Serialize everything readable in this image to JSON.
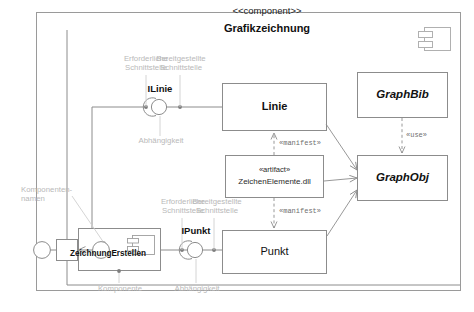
{
  "diagram": {
    "stereotype": "<<component>>",
    "title": "Grafikzeichnung"
  },
  "components": {
    "zeichnung_erstellen": "ZeichnungErstellen",
    "linie": "Linie",
    "punkt": "Punkt",
    "graphbib": "GraphBib",
    "graphobj": "GraphObj"
  },
  "artifact": {
    "stereotype": "«artifact»",
    "name": "ZeichenElemente.dll"
  },
  "interfaces": {
    "ilinie": "ILinie",
    "ipunkt": "IPunkt"
  },
  "dependencies": {
    "manifest_linie": "«manifest»",
    "manifest_punkt": "«manifest»",
    "use": "«use»"
  },
  "annotations": {
    "required_top": "Erforderliche\nSchnittstelle",
    "provided_top": "Bereitgestellte\nSchnittstelle",
    "dependency_top": "Abhängigkeit",
    "component_name": "Komponenten-\nnamen",
    "required_bottom": "Erforderliche\nSchnittstelle",
    "provided_bottom": "Bereitgestellte\nSchnittstelle",
    "component_bottom": "Komponente",
    "dependency_bottom": "Abhängigkeit"
  },
  "colors": {
    "line": "#8c8c8c",
    "frame": "#9a9a9a",
    "annotation": "#bdbdbd",
    "text": "#111111"
  }
}
